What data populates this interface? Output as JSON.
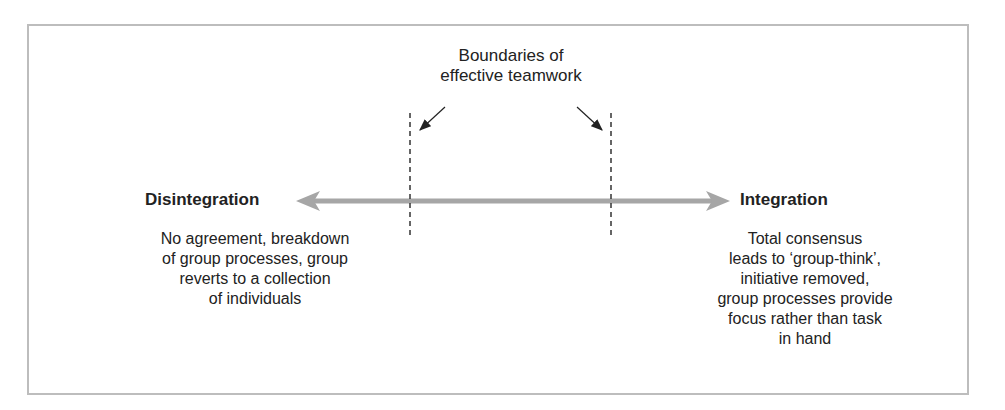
{
  "diagram": {
    "title": "Boundaries of effective teamwork",
    "title_lines": [
      "Boundaries of",
      "effective teamwork"
    ],
    "left": {
      "heading": "Disintegration",
      "description_lines": [
        "No agreement, breakdown",
        "of group processes, group",
        "reverts to a collection",
        "of individuals"
      ]
    },
    "right": {
      "heading": "Integration",
      "description_lines": [
        "Total consensus",
        "leads to ‘group-think’,",
        "initiative removed,",
        "group processes provide",
        "focus rather than task",
        "in hand"
      ]
    },
    "colors": {
      "arrow": "#a6a6a6",
      "border": "#bdbdbd",
      "text": "#222222",
      "dash": "#333333"
    }
  }
}
